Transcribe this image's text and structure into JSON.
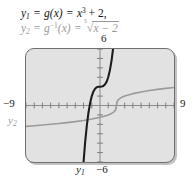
{
  "figure": {
    "kind": "graphing-calculator-screen",
    "equations": [
      {
        "id": "y1",
        "var": "y",
        "var_sub": "1",
        "text": "y₁ = g(x) = x³ + 2,",
        "function_name": "g",
        "expression": "x^3 + 2",
        "color": "#121212",
        "parts": {
          "lhs_var": "y",
          "lhs_sub": "1",
          "eq1": "=",
          "fn": "g",
          "arg": "(x)",
          "eq2": "=",
          "base": "x",
          "exp": "3",
          "plus": "+ 2,"
        }
      },
      {
        "id": "y2",
        "var": "y",
        "var_sub": "2",
        "text": "y₂ = g⁻¹(x) = ∛(x − 2)",
        "function_name": "g⁻¹",
        "expression": "cbrt(x - 2)",
        "color": "#9a9a9a",
        "parts": {
          "lhs_var": "y",
          "lhs_sub": "2",
          "eq1": "=",
          "fn": "g",
          "inv": "−1",
          "arg": "(x)",
          "eq2": "=",
          "radical_index": "3",
          "radicand": "x − 2"
        }
      }
    ],
    "window_labels": {
      "top": "6",
      "left": "−9",
      "right": "9",
      "bottom": "−6"
    },
    "curve_labels": {
      "y1": "y₁",
      "y1_sub": "1",
      "y2": "y₂",
      "y2_sub": "2"
    },
    "colors": {
      "screen_background": "#e2e2e2",
      "screen_border": "#6f6f6f",
      "curve_y1": "#1c1c1c",
      "curve_y2": "#9b9b9b",
      "axis": "#8e8e8e",
      "label": "#1a1a1a",
      "label_muted": "#9a9a9a"
    }
  },
  "chart_data": {
    "type": "line",
    "title": "",
    "xlabel": "",
    "ylabel": "",
    "xlim": [
      -9,
      9
    ],
    "ylim": [
      -6,
      6
    ],
    "xtick_step": 1,
    "ytick_step": 1,
    "grid": false,
    "legend": "inline-curve-labels",
    "series": [
      {
        "name": "y₁",
        "label": "y₁ = g(x) = x³ + 2",
        "formula": "y = x^3 + 2",
        "color": "#1c1c1c",
        "width": 2.1,
        "points": [
          [
            -2.0,
            -6.0
          ],
          [
            -1.8,
            -3.83
          ],
          [
            -1.6,
            -2.1
          ],
          [
            -1.4,
            -0.74
          ],
          [
            -1.2,
            0.27
          ],
          [
            -1.0,
            1.0
          ],
          [
            -0.8,
            1.49
          ],
          [
            -0.6,
            1.78
          ],
          [
            -0.4,
            1.94
          ],
          [
            -0.2,
            1.99
          ],
          [
            0.0,
            2.0
          ],
          [
            0.2,
            2.01
          ],
          [
            0.4,
            2.06
          ],
          [
            0.6,
            2.22
          ],
          [
            0.8,
            2.51
          ],
          [
            1.0,
            3.0
          ],
          [
            1.2,
            3.73
          ],
          [
            1.4,
            4.74
          ],
          [
            1.587,
            6.0
          ]
        ]
      },
      {
        "name": "y₂",
        "label": "y₂ = g⁻¹(x) = ∛(x − 2)",
        "formula": "y = cbrt(x - 2)",
        "color": "#9b9b9b",
        "width": 1.6,
        "points": [
          [
            -9.0,
            -2.22
          ],
          [
            -8.0,
            -2.154
          ],
          [
            -7.0,
            -2.08
          ],
          [
            -6.0,
            -2.0
          ],
          [
            -5.0,
            -1.913
          ],
          [
            -4.0,
            -1.817
          ],
          [
            -3.0,
            -1.71
          ],
          [
            -2.0,
            -1.587
          ],
          [
            -1.0,
            -1.442
          ],
          [
            0.0,
            -1.26
          ],
          [
            0.5,
            -1.145
          ],
          [
            1.0,
            -1.0
          ],
          [
            1.4,
            -0.843
          ],
          [
            1.7,
            -0.669
          ],
          [
            1.9,
            -0.464
          ],
          [
            2.0,
            0.0
          ],
          [
            2.1,
            0.464
          ],
          [
            2.3,
            0.669
          ],
          [
            2.6,
            0.843
          ],
          [
            3.0,
            1.0
          ],
          [
            4.0,
            1.26
          ],
          [
            5.0,
            1.442
          ],
          [
            6.0,
            1.587
          ],
          [
            7.0,
            1.71
          ],
          [
            8.0,
            1.817
          ],
          [
            9.0,
            1.913
          ]
        ]
      }
    ],
    "annotations": [
      {
        "text": "6",
        "position": "top-of-y-axis",
        "value": 6
      },
      {
        "text": "−9",
        "position": "left-of-x-axis",
        "value": -9
      },
      {
        "text": "9",
        "position": "right-of-x-axis",
        "value": 9
      },
      {
        "text": "−6",
        "position": "bottom-of-y-axis",
        "value": -6
      },
      {
        "text": "y₁",
        "position": "below-screen-left-of-minus6"
      },
      {
        "text": "y₂",
        "position": "left-edge-below-x-axis"
      }
    ]
  }
}
